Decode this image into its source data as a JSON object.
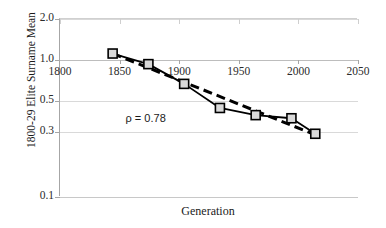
{
  "chart_data": {
    "type": "line",
    "title": "",
    "xlabel": "Generation",
    "ylabel": "1800-29 Elite Surname Mean",
    "yscale": "log",
    "ylim": [
      0.1,
      2.0
    ],
    "xlim": [
      1800,
      2050
    ],
    "grid": true,
    "legend": "none",
    "y_ticks": [
      {
        "label": "2.0",
        "value": 2.0
      },
      {
        "label": "1.0",
        "value": 1.0
      },
      {
        "label": "0.5",
        "value": 0.5
      },
      {
        "label": "0.3",
        "value": 0.3
      },
      {
        "label": "0.1",
        "value": 0.1
      }
    ],
    "x_ticks": [
      {
        "label": "1800",
        "value": 1800
      },
      {
        "label": "1850",
        "value": 1850
      },
      {
        "label": "1900",
        "value": 1900
      },
      {
        "label": "1950",
        "value": 1950
      },
      {
        "label": "2000",
        "value": 2000
      },
      {
        "label": "2050",
        "value": 2050
      }
    ],
    "annotations": [
      {
        "text": "ρ = 0.78",
        "x": 1855,
        "y": 0.38
      }
    ],
    "series": [
      {
        "name": "Elite surname mean",
        "style": "solid-with-square-markers",
        "color": "#000000",
        "marker_fill": "#d9d9d9",
        "marker_edge": "#000000",
        "x": [
          1845,
          1875,
          1905,
          1935,
          1965,
          1995,
          2015
        ],
        "values": [
          1.1,
          0.92,
          0.66,
          0.44,
          0.39,
          0.37,
          0.285
        ]
      },
      {
        "name": "Fitted trend",
        "style": "dashed",
        "color": "#000000",
        "x": [
          1845,
          2015
        ],
        "values": [
          1.1,
          0.28
        ]
      }
    ]
  },
  "axis_titles": {
    "y": "1800-29 Elite Surname Mean",
    "x": "Generation"
  },
  "annotation": {
    "rho": "ρ = 0.78"
  }
}
